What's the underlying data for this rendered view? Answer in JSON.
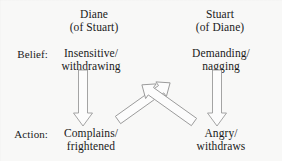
{
  "figure": {
    "background_color": "#f8f8f7",
    "text_color": "#1a1a1a",
    "arrow_fill": "#fcfcfc",
    "arrow_stroke": "#9a9a9a"
  },
  "columns": [
    {
      "id": "diane",
      "name": "Diane",
      "qualifier": "(of Stuart)",
      "belief": "Insensitive/\nwithdrawing",
      "belief_line1": "Insensitive/",
      "belief_line2": "withdrawing",
      "action": "Complains/\nfrightened",
      "action_line1": "Complains/",
      "action_line2": "frightened"
    },
    {
      "id": "stuart",
      "name": "Stuart",
      "qualifier": "(of Diane)",
      "belief": "Demanding/\nnagging",
      "belief_line1": "Demanding/",
      "belief_line2": "nagging",
      "action": "Angry/\nwithdraws",
      "action_line1": "Angry/",
      "action_line2": "withdraws"
    }
  ],
  "rows": [
    {
      "id": "belief",
      "label": "Belief:"
    },
    {
      "id": "action",
      "label": "Action:"
    }
  ],
  "arrows": [
    {
      "id": "diane-belief-to-action",
      "kind": "block-arrow-down",
      "from": "Diane belief (Insensitive/withdrawing)",
      "to": "Diane action (Complains/frightened)",
      "direction": "down"
    },
    {
      "id": "stuart-belief-to-action",
      "kind": "block-arrow-down",
      "from": "Stuart belief (Demanding/nagging)",
      "to": "Stuart action (Angry/withdraws)",
      "direction": "down"
    },
    {
      "id": "diane-action-to-stuart-belief",
      "kind": "block-arrow-diagonal",
      "from": "Diane action (Complains/frightened)",
      "to": "Stuart belief (Demanding/nagging)",
      "direction": "up-right"
    },
    {
      "id": "stuart-action-to-diane-belief",
      "kind": "block-arrow-diagonal",
      "from": "Stuart action (Angry/withdraws)",
      "to": "Diane belief (Insensitive/withdrawing)",
      "direction": "up-left"
    }
  ]
}
